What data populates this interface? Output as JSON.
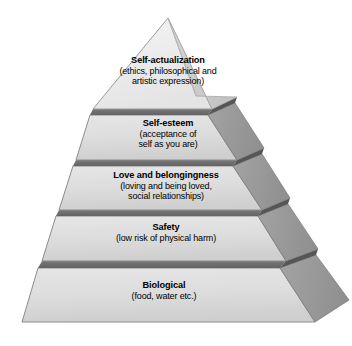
{
  "figure": {
    "name": "maslow-hierarchy-of-needs-pyramid",
    "background_color": "#ffffff",
    "front_face_color": "#dcdcdc",
    "side_face_color": "#9a9a9a",
    "divider_color": "#6e6e6e",
    "outline_color": "#8c8c8c",
    "text_color": "#000000"
  },
  "tiers": [
    {
      "level": 5,
      "id": "self-actualization",
      "title": "Self-actualization",
      "subtitle_lines": [
        "(ethics, philosophical and",
        "artistic expression)"
      ]
    },
    {
      "level": 4,
      "id": "self-esteem",
      "title": "Self-esteem",
      "subtitle_lines": [
        "(acceptance of",
        "self as you are)"
      ]
    },
    {
      "level": 3,
      "id": "love-and-belongingness",
      "title": "Love and belongingness",
      "subtitle_lines": [
        "(loving and being loved,",
        "social relationships)"
      ]
    },
    {
      "level": 2,
      "id": "safety",
      "title": "Safety",
      "subtitle_lines": [
        "(low risk of physical harm)"
      ]
    },
    {
      "level": 1,
      "id": "biological",
      "title": "Biological",
      "subtitle_lines": [
        "(food, water etc.)"
      ]
    }
  ]
}
